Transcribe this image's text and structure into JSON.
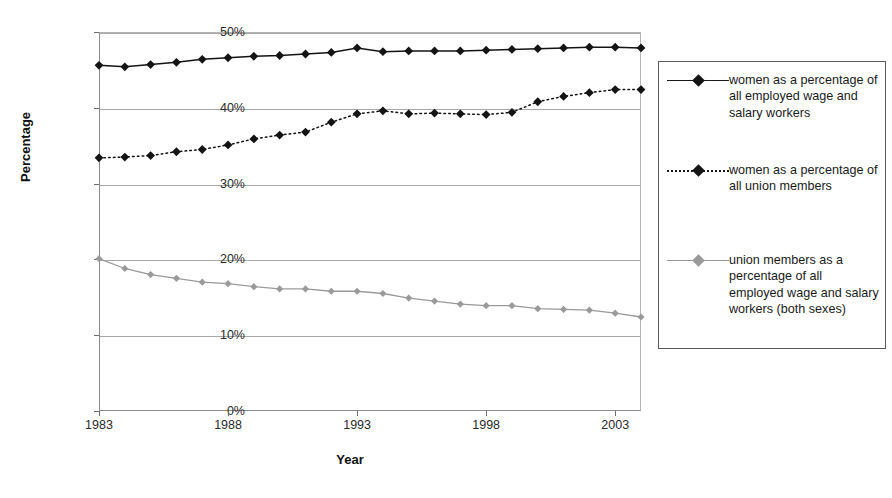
{
  "chart_data": {
    "type": "line",
    "title": "",
    "xlabel": "Year",
    "ylabel": "Percentage",
    "x": [
      1983,
      1984,
      1985,
      1986,
      1987,
      1988,
      1989,
      1990,
      1991,
      1992,
      1993,
      1994,
      1995,
      1996,
      1997,
      1998,
      1999,
      2000,
      2001,
      2002,
      2003,
      2004
    ],
    "xlim": [
      1983,
      2004
    ],
    "ylim": [
      0,
      50
    ],
    "yticks": [
      0,
      10,
      20,
      30,
      40,
      50
    ],
    "ytick_labels": [
      "0%",
      "10%",
      "20%",
      "30%",
      "40%",
      "50%"
    ],
    "xticks": [
      1983,
      1988,
      1993,
      1998,
      2003
    ],
    "xtick_labels": [
      "1983",
      "1988",
      "1993",
      "1998",
      "2003"
    ],
    "grid": "horizontal",
    "legend_position": "right",
    "series": [
      {
        "name": "women as a percentage of all employed wage and salary workers",
        "color": "#141414",
        "line_style": "solid",
        "marker": "diamond",
        "values": [
          45.6,
          45.4,
          45.7,
          46.0,
          46.4,
          46.6,
          46.8,
          46.9,
          47.1,
          47.3,
          47.9,
          47.4,
          47.5,
          47.5,
          47.5,
          47.6,
          47.7,
          47.8,
          47.9,
          48.0,
          48.0,
          47.9
        ]
      },
      {
        "name": "women as a percentage of all union members",
        "color": "#141414",
        "line_style": "dotted",
        "marker": "diamond",
        "values": [
          33.4,
          33.5,
          33.7,
          34.2,
          34.5,
          35.1,
          35.9,
          36.4,
          36.8,
          38.1,
          39.2,
          39.6,
          39.2,
          39.3,
          39.2,
          39.1,
          39.4,
          40.8,
          41.5,
          42.0,
          42.4,
          42.4
        ]
      },
      {
        "name": "union members as a percentage of all employed wage and salary workers (both sexes)",
        "color": "#9a9a9a",
        "line_style": "solid",
        "marker": "diamond",
        "values": [
          20.1,
          18.8,
          18.0,
          17.5,
          17.0,
          16.8,
          16.4,
          16.1,
          16.1,
          15.8,
          15.8,
          15.5,
          14.9,
          14.5,
          14.1,
          13.9,
          13.9,
          13.5,
          13.4,
          13.3,
          12.9,
          12.4
        ]
      }
    ]
  },
  "legend": {
    "items": [
      {
        "label": "women as a percentage of all employed wage and salary workers",
        "key": "solid-dark"
      },
      {
        "label": "women as a percentage of all union members",
        "key": "dotted-dark"
      },
      {
        "label": "union members as a percentage of all employed wage and salary workers (both sexes)",
        "key": "solid-gray"
      }
    ]
  }
}
